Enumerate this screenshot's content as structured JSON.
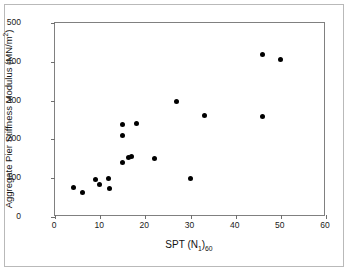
{
  "chart_data": {
    "type": "scatter",
    "title": "",
    "xlabel": "SPT (N1)60",
    "ylabel": "Aggregate Pier Stiffness Modulus (MN/m2)",
    "xlabel_parts": {
      "prefix": "SPT (N",
      "sub1": "1",
      "mid": ")",
      "sub2": "60"
    },
    "ylabel_parts": {
      "prefix": "Aggregate Pier Stiffness Modulus (MN/m",
      "sup": "2",
      "suffix": ")"
    },
    "xlim": [
      0,
      60
    ],
    "ylim": [
      0,
      500
    ],
    "xticks": [
      0,
      10,
      20,
      30,
      40,
      50,
      60
    ],
    "yticks": [
      0,
      100,
      200,
      300,
      400,
      500
    ],
    "grid": false,
    "legend": false,
    "marker": "filled-circle",
    "marker_color": "#000000",
    "points": [
      {
        "x": 4,
        "y": 75
      },
      {
        "x": 6,
        "y": 62
      },
      {
        "x": 9,
        "y": 97
      },
      {
        "x": 9.8,
        "y": 85
      },
      {
        "x": 11.8,
        "y": 99
      },
      {
        "x": 12,
        "y": 73
      },
      {
        "x": 15,
        "y": 141
      },
      {
        "x": 15,
        "y": 211
      },
      {
        "x": 15,
        "y": 238
      },
      {
        "x": 16.3,
        "y": 153
      },
      {
        "x": 17,
        "y": 157
      },
      {
        "x": 18,
        "y": 240
      },
      {
        "x": 22,
        "y": 152
      },
      {
        "x": 27,
        "y": 298
      },
      {
        "x": 30,
        "y": 99
      },
      {
        "x": 33,
        "y": 261
      },
      {
        "x": 46,
        "y": 418
      },
      {
        "x": 46,
        "y": 258
      },
      {
        "x": 50,
        "y": 405
      }
    ]
  }
}
